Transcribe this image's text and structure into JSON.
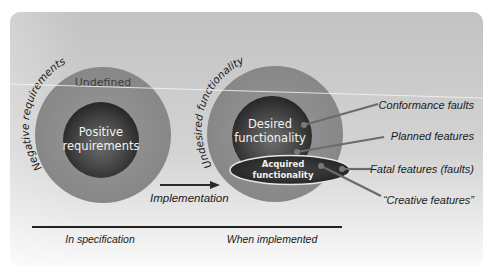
{
  "diagram": {
    "colors": {
      "panel_top": "#c4c4c4",
      "panel_bottom": "#f4f4f4",
      "outer_ring": "#8e8e8e",
      "inner_core_center": "#6a6a6a",
      "inner_core_edge": "#2c2c2c",
      "ellipse_fill": "#2e2e2e",
      "ellipse_stroke": "#e8e8e8",
      "leader_line": "#6e6e6e",
      "divider": "#222222"
    },
    "left_set": {
      "arc_label": "Negative requirements",
      "ring_label": "Undefined",
      "core_label_line1": "Positive",
      "core_label_line2": "requirements"
    },
    "right_set": {
      "arc_label": "Undesired functionality",
      "core_label_line1": "Desired",
      "core_label_line2": "functionality",
      "ellipse_label_line1": "Acquired",
      "ellipse_label_line2": "functionality"
    },
    "transition": {
      "arrow_label": "Implementation"
    },
    "callouts": [
      {
        "label": "Conformance faults"
      },
      {
        "label": "Planned features"
      },
      {
        "label": "Fatal features (faults)"
      },
      {
        "label": "“Creative features”"
      }
    ],
    "footer": {
      "left_caption": "In specification",
      "right_caption": "When implemented"
    }
  }
}
